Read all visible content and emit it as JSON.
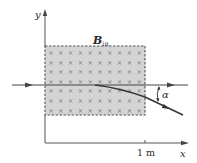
{
  "diagram": {
    "type": "physics-magnetic-deflection",
    "field_label_main": "B",
    "field_label_sub": "in",
    "axis_y_label": "y",
    "axis_x_label": "x",
    "tick_label": "1 m",
    "angle_label": "α",
    "field_region": {
      "fill_color": "#d4d4d4",
      "border_color": "#555555",
      "border_style": "dashed",
      "marker": "×",
      "marker_rows": 7,
      "marker_cols": 10
    },
    "colors": {
      "line": "#333333",
      "axis": "#555555",
      "marker": "#777777"
    }
  }
}
